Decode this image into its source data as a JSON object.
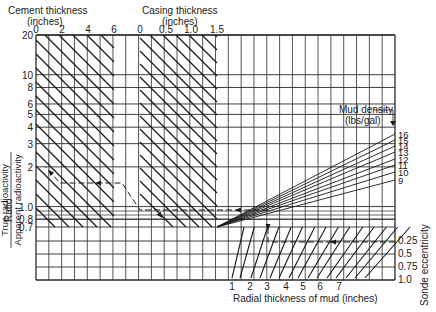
{
  "chart_data": {
    "type": "nomogram",
    "y_axis": {
      "label_prefix": "Ratio",
      "label_numerator": "True radioactivity",
      "label_denominator": "Apparent radioactivity",
      "scale": "log",
      "ticks": [
        "20",
        "10",
        "8",
        "6",
        "5",
        "4",
        "3",
        "2",
        "1.0",
        "0.8",
        "0.7"
      ],
      "tick_values": [
        20,
        10,
        8,
        6,
        5,
        4,
        3,
        2,
        1.0,
        0.8,
        0.7
      ]
    },
    "top_axes": [
      {
        "title_line1": "Cement thickness",
        "title_line2": "(inches)",
        "ticks": [
          "0",
          "2",
          "4",
          "6"
        ],
        "values": [
          0,
          2,
          4,
          6
        ]
      },
      {
        "title_line1": "Casing thickness",
        "title_line2": "(inches)",
        "ticks": [
          "0",
          "0.5",
          "1.0",
          "1.5"
        ],
        "values": [
          0,
          0.5,
          1.0,
          1.5
        ]
      }
    ],
    "mud_density": {
      "title_line1": "Mud density",
      "title_line2": "(lbs/gal)",
      "curves": [
        "16",
        "15",
        "14",
        "13",
        "12",
        "11",
        "10",
        "9"
      ],
      "values": [
        16,
        15,
        14,
        13,
        12,
        11,
        10,
        9
      ]
    },
    "x_axis_bottom": {
      "label": "Radial thickness of mud (inches)",
      "ticks": [
        "1",
        "2",
        "3",
        "4",
        "5",
        "6",
        "7"
      ],
      "values": [
        1,
        2,
        3,
        4,
        5,
        6,
        7
      ]
    },
    "sonde_eccentricity": {
      "label": "Sonde eccentricity",
      "ticks": [
        "0.25",
        "0.5",
        "0.75",
        "1.0"
      ],
      "values": [
        0.25,
        0.5,
        0.75,
        1.0
      ]
    },
    "example_path": {
      "description": "Dashed example path: eccentricity 0.25 → mud thickness 3 in → mud density curve → casing → cement → ratio ≈ 2.1",
      "result_ratio": 2.1
    },
    "grid": true
  }
}
